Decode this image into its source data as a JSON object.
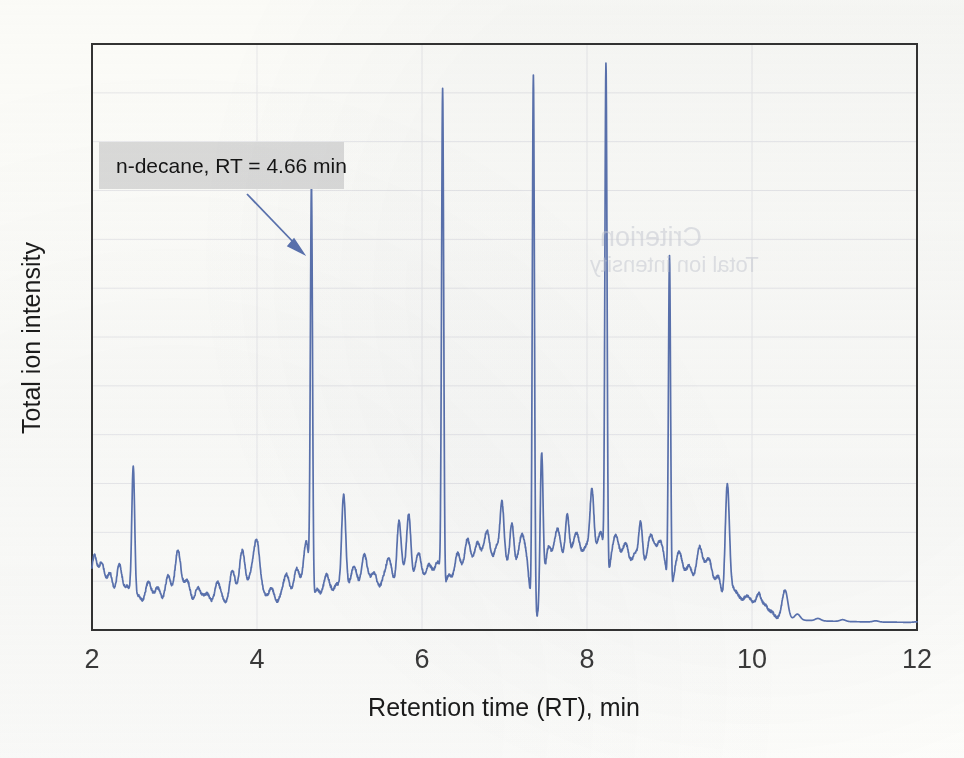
{
  "figure": {
    "title": "",
    "y_axis_label": "Total ion intensity",
    "x_axis_label": "Retention time (RT), min",
    "annotation_label": "n-decane, RT = 4.66 min",
    "annotation_box_color": "#dcdcdc",
    "trace_color": "#5b73b0",
    "axis_color": "#333333",
    "grid_color": "#e9e9ec",
    "background_color": "#fdfdfb"
  },
  "x_ticks": [
    "2",
    "4",
    "6",
    "8",
    "10",
    "12"
  ],
  "chart_data": {
    "type": "line",
    "title": "",
    "xlabel": "Retention time (RT), min",
    "ylabel": "Total ion intensity",
    "xlim": [
      2,
      12
    ],
    "ylim": [
      0,
      100
    ],
    "xticks": [
      2,
      4,
      6,
      8,
      10,
      12
    ],
    "yticks": [],
    "grid": "horizontal-and-vertical-faint",
    "legend": "none",
    "annotations": [
      {
        "text": "n-decane, RT = 4.66 min",
        "target_x": 4.66,
        "target_y": 72,
        "box_x": 2.08,
        "box_y": 85,
        "arrow": true
      }
    ],
    "baseline": 2.0,
    "named_peaks": [
      {
        "label": "n-decane",
        "rt": 4.66,
        "height": 72
      },
      {
        "label": "",
        "rt": 2.5,
        "height": 26
      },
      {
        "label": "",
        "rt": 5.05,
        "height": 22
      },
      {
        "label": "",
        "rt": 6.25,
        "height": 88
      },
      {
        "label": "",
        "rt": 7.35,
        "height": 94
      },
      {
        "label": "",
        "rt": 7.45,
        "height": 29
      },
      {
        "label": "",
        "rt": 8.23,
        "height": 91
      },
      {
        "label": "",
        "rt": 9.0,
        "height": 60
      },
      {
        "label": "",
        "rt": 9.7,
        "height": 24
      },
      {
        "label": "",
        "rt": 10.4,
        "height": 7
      }
    ],
    "series": [
      {
        "name": "TIC",
        "peaks": [
          [
            2.02,
            11
          ],
          [
            2.07,
            5
          ],
          [
            2.12,
            9
          ],
          [
            2.17,
            4
          ],
          [
            2.22,
            8
          ],
          [
            2.27,
            3
          ],
          [
            2.33,
            10
          ],
          [
            2.39,
            4
          ],
          [
            2.44,
            6
          ],
          [
            2.5,
            26
          ],
          [
            2.56,
            5
          ],
          [
            2.62,
            3
          ],
          [
            2.68,
            7
          ],
          [
            2.74,
            4
          ],
          [
            2.8,
            6
          ],
          [
            2.86,
            3
          ],
          [
            2.92,
            8
          ],
          [
            2.98,
            4
          ],
          [
            3.04,
            12
          ],
          [
            3.1,
            5
          ],
          [
            3.16,
            7
          ],
          [
            3.22,
            3
          ],
          [
            3.28,
            6
          ],
          [
            3.34,
            4
          ],
          [
            3.4,
            5
          ],
          [
            3.46,
            3
          ],
          [
            3.52,
            7
          ],
          [
            3.58,
            4
          ],
          [
            3.64,
            3
          ],
          [
            3.7,
            9
          ],
          [
            3.76,
            4
          ],
          [
            3.82,
            12
          ],
          [
            3.88,
            5
          ],
          [
            3.94,
            8
          ],
          [
            4.0,
            13
          ],
          [
            4.06,
            5
          ],
          [
            4.12,
            4
          ],
          [
            4.18,
            6
          ],
          [
            4.24,
            3
          ],
          [
            4.3,
            5
          ],
          [
            4.36,
            8
          ],
          [
            4.42,
            4
          ],
          [
            4.48,
            9
          ],
          [
            4.54,
            5
          ],
          [
            4.6,
            14
          ],
          [
            4.66,
            72
          ],
          [
            4.72,
            6
          ],
          [
            4.78,
            4
          ],
          [
            4.84,
            8
          ],
          [
            4.9,
            5
          ],
          [
            4.97,
            7
          ],
          [
            5.05,
            22
          ],
          [
            5.12,
            6
          ],
          [
            5.18,
            9
          ],
          [
            5.24,
            5
          ],
          [
            5.3,
            11
          ],
          [
            5.36,
            6
          ],
          [
            5.42,
            8
          ],
          [
            5.48,
            5
          ],
          [
            5.54,
            7
          ],
          [
            5.6,
            10
          ],
          [
            5.66,
            6
          ],
          [
            5.72,
            16
          ],
          [
            5.78,
            9
          ],
          [
            5.84,
            17
          ],
          [
            5.9,
            7
          ],
          [
            5.96,
            11
          ],
          [
            6.02,
            6
          ],
          [
            6.08,
            9
          ],
          [
            6.14,
            7
          ],
          [
            6.2,
            10
          ],
          [
            6.25,
            88
          ],
          [
            6.31,
            8
          ],
          [
            6.37,
            6
          ],
          [
            6.43,
            11
          ],
          [
            6.49,
            7
          ],
          [
            6.55,
            13
          ],
          [
            6.61,
            8
          ],
          [
            6.67,
            12
          ],
          [
            6.73,
            9
          ],
          [
            6.79,
            14
          ],
          [
            6.85,
            8
          ],
          [
            6.91,
            12
          ],
          [
            6.97,
            18
          ],
          [
            7.03,
            10
          ],
          [
            7.09,
            15
          ],
          [
            7.15,
            9
          ],
          [
            7.21,
            13
          ],
          [
            7.27,
            10
          ],
          [
            7.35,
            94
          ],
          [
            7.45,
            29
          ],
          [
            7.52,
            12
          ],
          [
            7.58,
            9
          ],
          [
            7.64,
            14
          ],
          [
            7.7,
            10
          ],
          [
            7.76,
            16
          ],
          [
            7.82,
            11
          ],
          [
            7.88,
            13
          ],
          [
            7.94,
            9
          ],
          [
            8.0,
            12
          ],
          [
            8.06,
            20
          ],
          [
            8.12,
            11
          ],
          [
            8.18,
            14
          ],
          [
            8.23,
            91
          ],
          [
            8.29,
            10
          ],
          [
            8.35,
            13
          ],
          [
            8.41,
            9
          ],
          [
            8.47,
            12
          ],
          [
            8.53,
            8
          ],
          [
            8.59,
            11
          ],
          [
            8.65,
            15
          ],
          [
            8.71,
            9
          ],
          [
            8.77,
            13
          ],
          [
            8.83,
            10
          ],
          [
            8.89,
            12
          ],
          [
            8.95,
            9
          ],
          [
            9.0,
            60
          ],
          [
            9.06,
            8
          ],
          [
            9.12,
            11
          ],
          [
            9.18,
            7
          ],
          [
            9.24,
            9
          ],
          [
            9.3,
            6
          ],
          [
            9.36,
            12
          ],
          [
            9.42,
            8
          ],
          [
            9.48,
            10
          ],
          [
            9.54,
            6
          ],
          [
            9.6,
            8
          ],
          [
            9.7,
            24
          ],
          [
            9.76,
            6
          ],
          [
            9.82,
            5
          ],
          [
            9.88,
            4
          ],
          [
            9.94,
            5
          ],
          [
            10.0,
            4
          ],
          [
            10.08,
            6
          ],
          [
            10.16,
            4
          ],
          [
            10.24,
            3
          ],
          [
            10.4,
            7
          ],
          [
            10.55,
            3
          ],
          [
            10.8,
            2.4
          ],
          [
            11.1,
            2.3
          ],
          [
            11.5,
            2.2
          ],
          [
            12.0,
            2.1
          ]
        ]
      }
    ]
  }
}
